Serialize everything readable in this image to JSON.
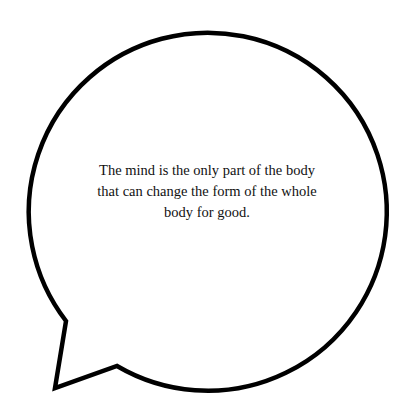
{
  "speech_bubble": {
    "quote": "The mind is the only part of the body that can change the form of the whole body for good.",
    "stroke_color": "#000000",
    "fill_color": "#ffffff"
  }
}
